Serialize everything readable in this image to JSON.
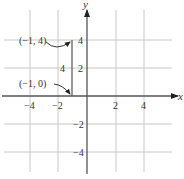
{
  "figure": {
    "type": "coordinate-plane",
    "x_axis_label": "x",
    "y_axis_label": "y",
    "x_ticks": [
      {
        "value": -4,
        "label": "−4"
      },
      {
        "value": -2,
        "label": "−2"
      },
      {
        "value": 2,
        "label": "2"
      },
      {
        "value": 4,
        "label": "4"
      }
    ],
    "y_ticks": [
      {
        "value": 4,
        "label": "4"
      },
      {
        "value": 2,
        "label": "2"
      },
      {
        "value": -2,
        "label": "−2"
      },
      {
        "value": -4,
        "label": "−4"
      }
    ],
    "grid": true,
    "points": [
      {
        "label": "(−1, 4)",
        "x": -1,
        "y": 4
      },
      {
        "label": "(−1, 0)",
        "x": -1,
        "y": 0
      }
    ],
    "segment": {
      "from": [
        -1,
        0
      ],
      "to": [
        -1,
        4
      ],
      "length_label": "4"
    },
    "colors": {
      "grid": "#c8c8c8",
      "axis": "#555555",
      "segment": "#555555",
      "text": "#333333"
    }
  }
}
